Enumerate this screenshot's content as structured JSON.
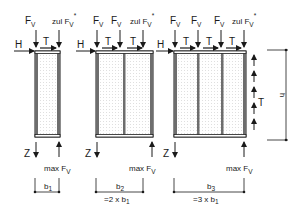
{
  "diagram": {
    "colors": {
      "stroke": "#1a1a1a",
      "fill_dots": "#bdbdbd",
      "frame": "#6e6e6e"
    },
    "labels": {
      "force_v": "F",
      "force_v_sub": "V",
      "zul_prefix": "zul F",
      "star": "*",
      "horizontal": "H",
      "shear": "T",
      "tension": "Z",
      "max_prefix": "max F",
      "height": "h"
    },
    "panels": [
      {
        "id": 1,
        "modules": 1,
        "width_label": "b",
        "width_sub": "1",
        "relation": ""
      },
      {
        "id": 2,
        "modules": 2,
        "width_label": "b",
        "width_sub": "2",
        "relation_prefix": "=2  x  b",
        "relation_sub": "1"
      },
      {
        "id": 3,
        "modules": 3,
        "width_label": "b",
        "width_sub": "3",
        "relation_prefix": "=3  x  b",
        "relation_sub": "1"
      }
    ]
  }
}
